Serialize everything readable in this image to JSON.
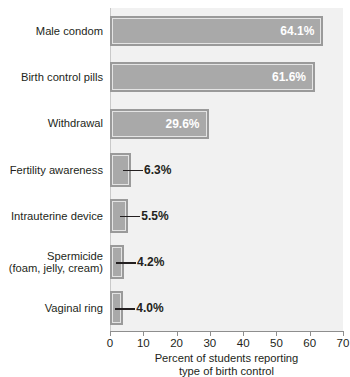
{
  "chart_data": {
    "type": "bar",
    "orientation": "horizontal",
    "title": "",
    "xlabel": "Percent of students reporting type of birth control",
    "xlabel_lines": [
      "Percent of students reporting",
      "type of birth control"
    ],
    "ylabel": "",
    "xlim": [
      0,
      70
    ],
    "xticks": [
      0,
      10,
      20,
      30,
      40,
      50,
      60,
      70
    ],
    "xtick_labels": [
      "0",
      "10",
      "20",
      "30",
      "40",
      "50",
      "60",
      "70"
    ],
    "grid": false,
    "legend": null,
    "value_suffix": "%",
    "categories": [
      "Male condom",
      "Birth control pills",
      "Withdrawal",
      "Fertility awareness",
      "Intrauterine device",
      "Spermicide\n(foam, jelly, cream)",
      "Vaginal ring"
    ],
    "values": [
      64.1,
      61.6,
      29.6,
      6.3,
      5.5,
      4.2,
      4.0
    ],
    "data_labels": [
      "64.1%",
      "61.6%",
      "29.6%",
      "6.3%",
      "5.5%",
      "4.2%",
      "4.0%"
    ],
    "label_placement": [
      "inside",
      "inside",
      "inside",
      "outside",
      "outside",
      "outside",
      "outside"
    ],
    "colors": {
      "bar_fill": "#a9a9a9",
      "bar_border": "#9a9a9a",
      "bar_inner_line": "#e4e4e4",
      "plot_background": "#f1f1f1",
      "inside_label": "#ffffff",
      "outside_label": "#231f20",
      "axis": "#8e8e8e",
      "text": "#231f20"
    }
  }
}
